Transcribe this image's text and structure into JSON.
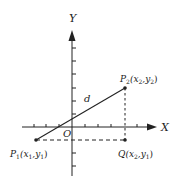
{
  "diagram": {
    "axes": {
      "x_label": "X",
      "y_label": "Y",
      "origin_label": "O"
    },
    "points": {
      "p1": {
        "name": "P",
        "sub": "1",
        "coords": "(x",
        "c1sub": "1",
        "mid": ",y",
        "c2sub": "1",
        "close": ")"
      },
      "p2": {
        "name": "P",
        "sub": "2",
        "coords": "(x",
        "c1sub": "2",
        "mid": ",y",
        "c2sub": "2",
        "close": ")"
      },
      "q": {
        "name": "Q",
        "coords": "(x",
        "c1sub": "2",
        "mid": ",y",
        "c2sub": "1",
        "close": ")"
      }
    },
    "segment_label": "d",
    "colors": {
      "ink": "#222222",
      "background": "#ffffff"
    }
  }
}
